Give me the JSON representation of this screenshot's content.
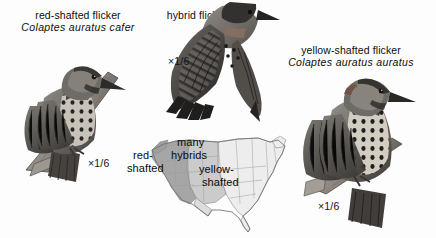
{
  "figure": {
    "background_color": "#fdfdfd"
  },
  "specimens": [
    {
      "id": "red-shafted",
      "common_name": "red-shafted flicker",
      "scientific_name": "Colaptes auratus cafer",
      "scale_label": "×1/6",
      "pose": "perched-on-branch"
    },
    {
      "id": "hybrid",
      "common_name": "hybrid flicker",
      "scientific_name": "",
      "scale_label": "×1/6",
      "pose": "wings-spread-in-flight"
    },
    {
      "id": "yellow-shafted",
      "common_name": "yellow-shafted flicker",
      "scientific_name": "Colaptes auratus auratus",
      "scale_label": "×1/6",
      "pose": "perched-on-branch"
    }
  ],
  "range_map": {
    "region": "United States",
    "labels": {
      "west_line1": "red-",
      "west_line2": "shafted",
      "middle_line1": "many",
      "middle_line2": "hybrids",
      "east_line1": "yellow-",
      "east_line2": "shafted"
    },
    "zone_colors": {
      "red_shafted": "#a8a8a8",
      "hybrid": "#c9c9c9",
      "yellow_shafted": "#ececec",
      "border": "#8c8c8c"
    }
  }
}
